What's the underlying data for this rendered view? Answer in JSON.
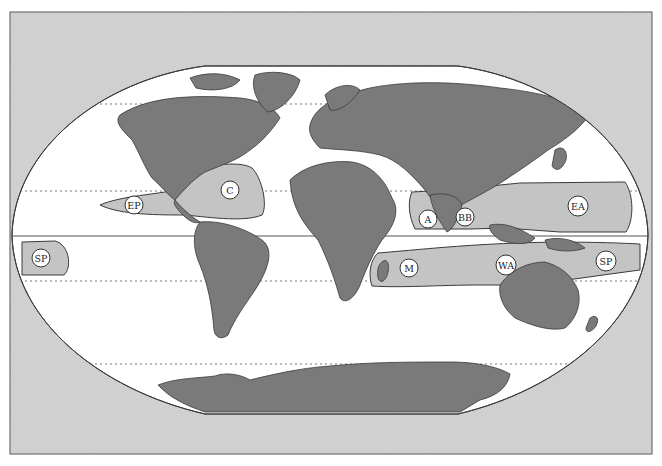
{
  "map": {
    "title": "",
    "projection": "flat-polar (rounded)",
    "colors": {
      "frame_fill": "#d2d2d2",
      "ocean": "#ffffff",
      "land": "#7a7a7a",
      "basin_fill": "#c4c4c4",
      "outline": "#3a3a3a",
      "label_fill": "#ffffff"
    },
    "lines": {
      "equator": "solid",
      "tropic_of_cancer": "dotted",
      "tropic_of_capricorn": "dotted",
      "arctic_line": "dotted",
      "antarctic_line": "dotted"
    },
    "basins": [
      {
        "id": "EP",
        "label": "EP",
        "name": "Eastern Pacific"
      },
      {
        "id": "C",
        "label": "C",
        "name": "Caribbean / North Atlantic"
      },
      {
        "id": "A",
        "label": "A",
        "name": "Arabian Sea"
      },
      {
        "id": "BB",
        "label": "BB",
        "name": "Bay of Bengal"
      },
      {
        "id": "EA",
        "label": "EA",
        "name": "East Asia / Western North Pacific"
      },
      {
        "id": "SP_west",
        "label": "SP",
        "name": "South Pacific (west edge)"
      },
      {
        "id": "M",
        "label": "M",
        "name": "Madagascar / South-West Indian Ocean"
      },
      {
        "id": "WA",
        "label": "WA",
        "name": "Western Australia"
      },
      {
        "id": "SP_east",
        "label": "SP",
        "name": "South Pacific"
      }
    ]
  }
}
